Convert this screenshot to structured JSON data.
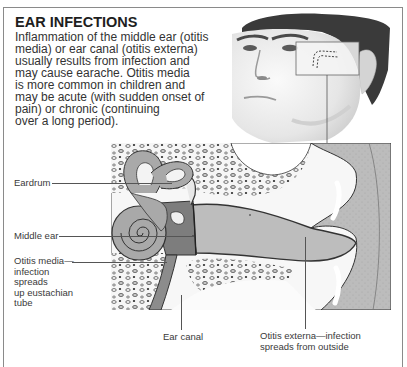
{
  "title": "EAR INFECTIONS",
  "intro_lines": [
    "Inflammation of the middle ear (otitis",
    "media) or ear canal (otitis externa)",
    "usually results from infection and",
    "may cause earache. Otitis media",
    "is more common in children and",
    "may be acute (with sudden onset of",
    "pain) or chronic (continuing",
    "over a long period)."
  ],
  "images": {
    "face": "Photo of young man's face, three-quarter view, with inset box over ear region",
    "inset": "Dashed outline of ear canal location",
    "diagram": "Cross-section illustration of the ear"
  },
  "labels": {
    "eardrum": "Eardrum",
    "middle_ear": "Middle ear",
    "otitis_media": [
      "Otitis media—",
      "infection",
      "spreads",
      "up eustachian",
      "tube"
    ],
    "ear_canal": "Ear canal",
    "otitis_externa": [
      "Otitis externa—infection",
      "spreads from outside"
    ]
  },
  "colors": {
    "frame": "#8a8a8a",
    "tissue_gray": "#b9b9b9",
    "dark_gray": "#7d7d7d",
    "bone_white": "#f4f4f4"
  }
}
